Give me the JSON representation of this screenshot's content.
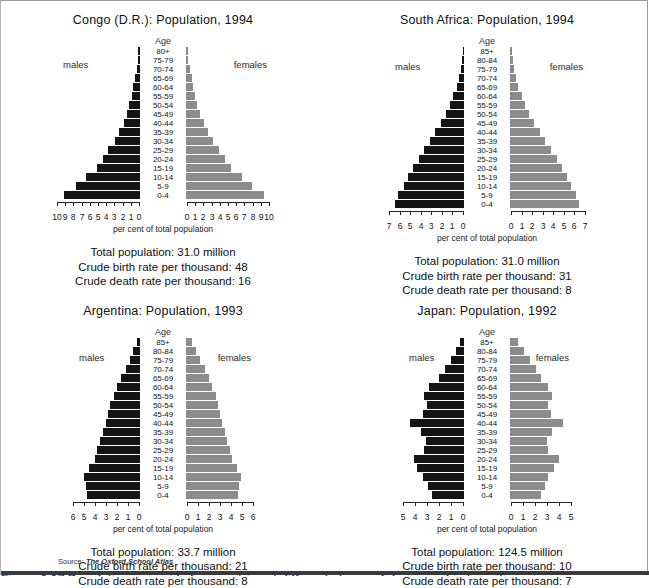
{
  "source": {
    "prefix": "Source:",
    "title": "The Oxford School Atlas"
  },
  "figure_caption": "Figure 1.17 Population pyramids for countries at different stages of demographic transition",
  "colors": {
    "male_bar": "#141414",
    "female_bar": "#8c8c8c",
    "axis": "#222222",
    "text": "#111111"
  },
  "labels": {
    "age": "Age",
    "males": "males",
    "females": "females",
    "axis_title": "per cent of total population",
    "total_population": "Total population:",
    "crude_birth": "Crude birth rate per thousand:",
    "crude_death": "Crude death rate per thousand:"
  },
  "age_groups_full": [
    "85+",
    "80-84",
    "75-79",
    "70-74",
    "65-69",
    "60-64",
    "55-59",
    "50-54",
    "45-49",
    "40-44",
    "35-39",
    "30-34",
    "25-29",
    "20-24",
    "15-19",
    "10-14",
    "5-9",
    "0-4"
  ],
  "age_groups_congo": [
    "80+",
    "75-79",
    "70-74",
    "65-69",
    "60-64",
    "55-59",
    "50-54",
    "45-49",
    "40-44",
    "35-39",
    "30-34",
    "25-29",
    "20-24",
    "15-19",
    "10-14",
    "5-9",
    "0-4"
  ],
  "chart_data": [
    {
      "type": "bar",
      "id": "congo",
      "title": "Congo (D.R.): Population, 1994",
      "xlabel": "per cent of total population",
      "ylabel": "Age",
      "xlim": [
        0,
        10
      ],
      "ticks": [
        0,
        1,
        2,
        3,
        4,
        5,
        6,
        7,
        8,
        9,
        10
      ],
      "left_tick_labels": [
        "10",
        "9",
        "8",
        "7",
        "6",
        "5",
        "4",
        "3",
        "2",
        "1",
        "0"
      ],
      "right_tick_labels": [
        "0",
        "1",
        "2",
        "3",
        "4",
        "5",
        "6",
        "7",
        "8",
        "9",
        "10"
      ],
      "categories": [
        "80+",
        "75-79",
        "70-74",
        "65-69",
        "60-64",
        "55-59",
        "50-54",
        "45-49",
        "40-44",
        "35-39",
        "30-34",
        "25-29",
        "20-24",
        "15-19",
        "10-14",
        "5-9",
        "0-4"
      ],
      "series": [
        {
          "name": "males",
          "values": [
            0.2,
            0.3,
            0.4,
            0.6,
            0.8,
            1.0,
            1.3,
            1.6,
            2.0,
            2.5,
            3.1,
            3.9,
            4.5,
            5.3,
            6.6,
            7.8,
            9.3
          ]
        },
        {
          "name": "females",
          "values": [
            0.2,
            0.3,
            0.5,
            0.7,
            0.9,
            1.1,
            1.4,
            1.7,
            2.2,
            2.7,
            3.3,
            4.0,
            4.7,
            5.5,
            6.8,
            8.0,
            9.5
          ]
        }
      ],
      "stats": {
        "total_population": "31.0 million",
        "crude_birth_rate": "48",
        "crude_death_rate": "16"
      }
    },
    {
      "type": "bar",
      "id": "south-africa",
      "title": "South Africa: Population, 1994",
      "xlabel": "per cent of total population",
      "ylabel": "Age",
      "xlim": [
        0,
        7
      ],
      "ticks": [
        0,
        1,
        2,
        3,
        4,
        5,
        6,
        7
      ],
      "left_tick_labels": [
        "7",
        "6",
        "5",
        "4",
        "3",
        "2",
        "1",
        "0"
      ],
      "right_tick_labels": [
        "0",
        "1",
        "2",
        "3",
        "4",
        "5",
        "6",
        "7"
      ],
      "categories": [
        "85+",
        "80-84",
        "75-79",
        "70-74",
        "65-69",
        "60-64",
        "55-59",
        "50-54",
        "45-49",
        "40-44",
        "35-39",
        "30-34",
        "25-29",
        "20-24",
        "15-19",
        "10-14",
        "5-9",
        "0-4"
      ],
      "series": [
        {
          "name": "males",
          "values": [
            0.1,
            0.2,
            0.3,
            0.5,
            0.7,
            1.0,
            1.3,
            1.7,
            2.2,
            2.7,
            3.2,
            3.8,
            4.3,
            4.8,
            5.3,
            5.7,
            6.2,
            6.5
          ]
        },
        {
          "name": "females",
          "values": [
            0.2,
            0.3,
            0.4,
            0.6,
            0.8,
            1.1,
            1.4,
            1.8,
            2.3,
            2.8,
            3.3,
            3.9,
            4.4,
            4.9,
            5.4,
            5.8,
            6.2,
            6.5
          ]
        }
      ],
      "stats": {
        "total_population": "31.0 million",
        "crude_birth_rate": "31",
        "crude_death_rate": "8"
      }
    },
    {
      "type": "bar",
      "id": "argentina",
      "title": "Argentina: Population, 1993",
      "xlabel": "per cent of total population",
      "ylabel": "Age",
      "xlim": [
        0,
        6
      ],
      "ticks": [
        0,
        1,
        2,
        3,
        4,
        5,
        6
      ],
      "left_tick_labels": [
        "6",
        "5",
        "4",
        "3",
        "2",
        "1",
        "0"
      ],
      "right_tick_labels": [
        "0",
        "1",
        "2",
        "3",
        "4",
        "5",
        "6"
      ],
      "categories": [
        "85+",
        "80-84",
        "75-79",
        "70-74",
        "65-69",
        "60-64",
        "55-59",
        "50-54",
        "45-49",
        "40-44",
        "35-39",
        "30-34",
        "25-29",
        "20-24",
        "15-19",
        "10-14",
        "5-9",
        "0-4"
      ],
      "series": [
        {
          "name": "males",
          "values": [
            0.3,
            0.6,
            0.9,
            1.3,
            1.7,
            2.1,
            2.4,
            2.7,
            2.9,
            3.1,
            3.4,
            3.6,
            3.9,
            4.1,
            4.6,
            5.1,
            4.9,
            4.8
          ]
        },
        {
          "name": "females",
          "values": [
            0.5,
            0.9,
            1.3,
            1.7,
            2.1,
            2.4,
            2.7,
            2.9,
            3.1,
            3.3,
            3.5,
            3.7,
            4.0,
            4.2,
            4.6,
            5.0,
            4.8,
            4.7
          ]
        }
      ],
      "stats": {
        "total_population": "33.7 million",
        "crude_birth_rate": "21",
        "crude_death_rate": "8"
      }
    },
    {
      "type": "bar",
      "id": "japan",
      "title": "Japan: Population, 1992",
      "xlabel": "per cent of total population",
      "ylabel": "Age",
      "xlim": [
        0,
        5
      ],
      "ticks": [
        0,
        1,
        2,
        3,
        4,
        5
      ],
      "left_tick_labels": [
        "5",
        "4",
        "3",
        "2",
        "1",
        "0"
      ],
      "right_tick_labels": [
        "0",
        "1",
        "2",
        "3",
        "4",
        "5"
      ],
      "categories": [
        "85+",
        "80-84",
        "75-79",
        "70-74",
        "65-69",
        "60-64",
        "55-59",
        "50-54",
        "45-49",
        "40-44",
        "35-39",
        "30-34",
        "25-29",
        "20-24",
        "15-19",
        "10-14",
        "5-9",
        "0-4"
      ],
      "series": [
        {
          "name": "males",
          "values": [
            0.3,
            0.7,
            1.1,
            1.6,
            2.1,
            2.9,
            3.3,
            3.1,
            3.4,
            4.5,
            3.6,
            3.2,
            3.3,
            4.2,
            3.9,
            3.4,
            3.0,
            2.7
          ]
        },
        {
          "name": "females",
          "values": [
            0.7,
            1.2,
            1.7,
            2.2,
            2.6,
            3.2,
            3.5,
            3.2,
            3.4,
            4.4,
            3.5,
            3.1,
            3.2,
            4.1,
            3.7,
            3.2,
            2.9,
            2.6
          ]
        }
      ],
      "stats": {
        "total_population": "124.5 million",
        "crude_birth_rate": "10",
        "crude_death_rate": "7"
      }
    }
  ]
}
